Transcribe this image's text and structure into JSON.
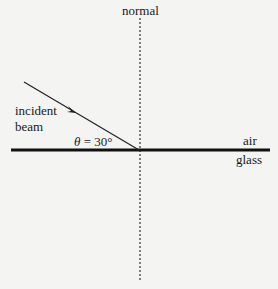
{
  "diagram": {
    "labels": {
      "normal": "normal",
      "incident_line1": "incident",
      "incident_line2": "beam",
      "theta_symbol": "θ",
      "angle_text": " = 30°",
      "air": "air",
      "glass": "glass"
    },
    "angle_deg": 30,
    "colors": {
      "background": "#f4f4f2",
      "line": "#1a1a1a",
      "normal": "#333333"
    }
  }
}
